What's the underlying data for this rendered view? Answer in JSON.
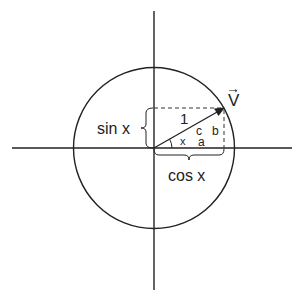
{
  "diagram": {
    "type": "unit-circle",
    "labels": {
      "vector": "V",
      "hypotenuse": "1",
      "sin": "sin x",
      "cos": "cos x",
      "angle": "x",
      "side_c": "c",
      "side_a": "a",
      "side_b": "b"
    },
    "colors": {
      "stroke": "#222222",
      "background": "#ffffff"
    }
  }
}
